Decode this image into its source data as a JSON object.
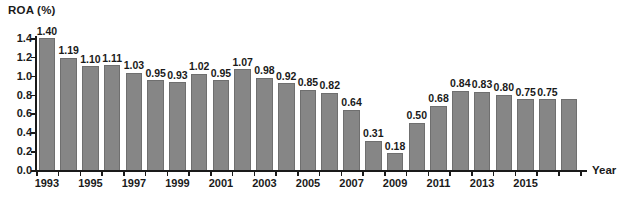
{
  "chart_data": {
    "type": "bar",
    "title": "",
    "xlabel": "Year",
    "ylabel": "ROA (%)",
    "ylim": [
      0.0,
      1.4
    ],
    "yticks": [
      "0.0",
      "0.2",
      "0.4",
      "0.6",
      "0.8",
      "1.0",
      "1.2",
      "1.4"
    ],
    "ytick_values": [
      0.0,
      0.2,
      0.4,
      0.6,
      0.8,
      1.0,
      1.2,
      1.4
    ],
    "grid": false,
    "legend": "none",
    "categories": [
      "1993",
      "1994",
      "1995",
      "1996",
      "1997",
      "1998",
      "1999",
      "2000",
      "2001",
      "2002",
      "2003",
      "2004",
      "2005",
      "2006",
      "2007",
      "2008",
      "2009",
      "2010",
      "2011",
      "2012",
      "2013",
      "2014",
      "2015",
      "2016",
      "2017"
    ],
    "values": [
      1.4,
      1.19,
      1.1,
      1.11,
      1.03,
      0.95,
      0.93,
      1.02,
      0.95,
      1.07,
      0.98,
      0.92,
      0.85,
      0.82,
      0.64,
      0.31,
      0.18,
      0.5,
      0.68,
      0.84,
      0.83,
      0.8,
      0.75,
      0.75,
      0.75
    ],
    "value_labels": [
      "1.40",
      "1.19",
      "1.10",
      "1.11",
      "1.03",
      "0.95",
      "0.93",
      "1.02",
      "0.95",
      "1.07",
      "0.98",
      "0.92",
      "0.85",
      "0.82",
      "0.64",
      "0.31",
      "0.18",
      "0.50",
      "0.68",
      "0.84",
      "0.83",
      "0.80",
      "0.75",
      "0.75",
      "0.75"
    ],
    "visible_value_labels": [
      "1.40",
      "1.19",
      "1.10",
      "1.11",
      "1.03",
      "0.95",
      "0.93",
      "1.02",
      "0.95",
      "1.07",
      "0.98",
      "0.92",
      "0.85",
      "0.82",
      "0.64",
      "0.31",
      "0.18",
      "0.50",
      "0.68",
      "0.84",
      "0.83",
      "0.80",
      "0.75",
      "0.75"
    ],
    "visible_xtick_labels": [
      "1993",
      "1995",
      "1997",
      "1999",
      "2001",
      "2003",
      "2005",
      "2007",
      "2009",
      "2011",
      "2013",
      "2015"
    ],
    "bar_color": "#868686",
    "bar_edge_color": "#6f6f6f",
    "axis_color": "#1a1a1a",
    "background_color": "#ffffff"
  }
}
